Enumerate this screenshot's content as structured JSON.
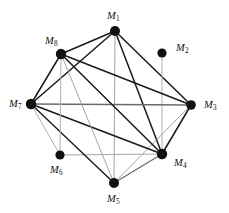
{
  "figure": {
    "type": "undirected-graph-diagram",
    "background_color": "#ffffff",
    "width": 229,
    "height": 213
  },
  "chart_data": {
    "type": "scatter",
    "title": "",
    "xlabel": "",
    "ylabel": "",
    "layout": "circular node-link graph, 8 vertices",
    "nodes": [
      {
        "id": "M1",
        "label": "M",
        "subscript": "1",
        "x": 115,
        "y": 31,
        "label_x": 107,
        "label_y": 11,
        "radius": 5.0,
        "color": "#111111"
      },
      {
        "id": "M2",
        "label": "M",
        "subscript": "2",
        "x": 162,
        "y": 53,
        "label_x": 176,
        "label_y": 43,
        "radius": 4.6,
        "color": "#111111"
      },
      {
        "id": "M3",
        "label": "M",
        "subscript": "3",
        "x": 191,
        "y": 105,
        "label_x": 204,
        "label_y": 100,
        "radius": 4.8,
        "color": "#111111"
      },
      {
        "id": "M4",
        "label": "M",
        "subscript": "4",
        "x": 162,
        "y": 154,
        "label_x": 174,
        "label_y": 158,
        "radius": 5.2,
        "color": "#111111"
      },
      {
        "id": "M5",
        "label": "M",
        "subscript": "5",
        "x": 114,
        "y": 183,
        "label_x": 107,
        "label_y": 194,
        "radius": 5.0,
        "color": "#111111"
      },
      {
        "id": "M6",
        "label": "M",
        "subscript": "6",
        "x": 60,
        "y": 155,
        "label_x": 50,
        "label_y": 165,
        "radius": 4.6,
        "color": "#111111"
      },
      {
        "id": "M7",
        "label": "M",
        "subscript": "7",
        "x": 31,
        "y": 104,
        "label_x": 9,
        "label_y": 99,
        "radius": 5.2,
        "color": "#111111"
      },
      {
        "id": "M8",
        "label": "M",
        "subscript": "8",
        "x": 61,
        "y": 54,
        "label_x": 45,
        "label_y": 36,
        "radius": 5.2,
        "color": "#111111"
      }
    ],
    "edges": [
      {
        "from": "M1",
        "to": "M8",
        "style": "solid",
        "color": "#1a1a1a",
        "width": 1.5
      },
      {
        "from": "M1",
        "to": "M7",
        "style": "solid",
        "color": "#1a1a1a",
        "width": 1.5
      },
      {
        "from": "M1",
        "to": "M3",
        "style": "solid",
        "color": "#1a1a1a",
        "width": 1.5
      },
      {
        "from": "M1",
        "to": "M4",
        "style": "solid",
        "color": "#1a1a1a",
        "width": 1.5
      },
      {
        "from": "M1",
        "to": "M5",
        "style": "solid",
        "color": "#9a9a9a",
        "width": 0.9
      },
      {
        "from": "M2",
        "to": "M4",
        "style": "solid",
        "color": "#b0b0b0",
        "width": 1.0
      },
      {
        "from": "M3",
        "to": "M8",
        "style": "solid",
        "color": "#1a1a1a",
        "width": 1.5
      },
      {
        "from": "M3",
        "to": "M7",
        "style": "solid",
        "color": "#6a6a6a",
        "width": 1.4
      },
      {
        "from": "M3",
        "to": "M4",
        "style": "solid",
        "color": "#1a1a1a",
        "width": 1.5
      },
      {
        "from": "M3",
        "to": "M5",
        "style": "solid",
        "color": "#9a9a9a",
        "width": 0.9
      },
      {
        "from": "M4",
        "to": "M8",
        "style": "solid",
        "color": "#1a1a1a",
        "width": 1.5
      },
      {
        "from": "M4",
        "to": "M7",
        "style": "solid",
        "color": "#1a1a1a",
        "width": 1.5
      },
      {
        "from": "M4",
        "to": "M6",
        "style": "solid",
        "color": "#a8a8a8",
        "width": 1.0
      },
      {
        "from": "M4",
        "to": "M5",
        "style": "solid",
        "color": "#6a6a6a",
        "width": 1.2
      },
      {
        "from": "M5",
        "to": "M8",
        "style": "solid",
        "color": "#9a9a9a",
        "width": 0.9
      },
      {
        "from": "M5",
        "to": "M7",
        "style": "solid",
        "color": "#1a1a1a",
        "width": 1.4
      },
      {
        "from": "M6",
        "to": "M8",
        "style": "solid",
        "color": "#b0b0b0",
        "width": 1.0
      },
      {
        "from": "M6",
        "to": "M7",
        "style": "solid",
        "color": "#b0b0b0",
        "width": 1.0
      },
      {
        "from": "M7",
        "to": "M8",
        "style": "solid",
        "color": "#1a1a1a",
        "width": 1.5
      }
    ],
    "node_count": 8,
    "edge_count": 19
  }
}
